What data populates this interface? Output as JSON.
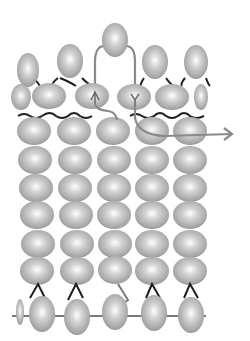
{
  "diagram": {
    "type": "bead-weaving-thread-path",
    "bead_color": "#b4b4b4",
    "thread_color_black": "#1e1e1e",
    "thread_color_path": "#8a8a8a",
    "grid": {
      "columns": [
        34,
        74,
        113,
        152,
        190
      ],
      "rows": [
        130,
        158,
        186,
        214,
        242,
        271
      ],
      "bead_rx": 17,
      "bead_ry": 14
    },
    "top_row": [
      {
        "cx": 28,
        "cy": 68,
        "rx": 14,
        "ry": 17
      },
      {
        "cx": 70,
        "cy": 59,
        "rx": 13,
        "ry": 17
      },
      {
        "cx": 115,
        "cy": 40,
        "rx": 13,
        "ry": 17
      },
      {
        "cx": 155,
        "cy": 60,
        "rx": 13,
        "ry": 17
      },
      {
        "cx": 196,
        "cy": 62,
        "rx": 12,
        "ry": 17
      }
    ],
    "second_row": [
      {
        "cx": 22,
        "cy": 97,
        "rx": 10,
        "ry": 13
      },
      {
        "cx": 49,
        "cy": 95,
        "rx": 17,
        "ry": 13
      },
      {
        "cx": 92,
        "cy": 95,
        "rx": 17,
        "ry": 13
      },
      {
        "cx": 134,
        "cy": 96,
        "rx": 17,
        "ry": 13
      },
      {
        "cx": 173,
        "cy": 96,
        "rx": 17,
        "ry": 13
      },
      {
        "cx": 200,
        "cy": 96,
        "rx": 8,
        "ry": 13
      }
    ],
    "bottom_row": [
      {
        "cx": 20,
        "cy": 310,
        "rx": 4,
        "ry": 14
      },
      {
        "cx": 42,
        "cy": 312,
        "rx": 13,
        "ry": 18
      },
      {
        "cx": 77,
        "cy": 315,
        "rx": 13,
        "ry": 18
      },
      {
        "cx": 115,
        "cy": 310,
        "rx": 13,
        "ry": 18
      },
      {
        "cx": 154,
        "cy": 312,
        "rx": 13,
        "ry": 18
      },
      {
        "cx": 191,
        "cy": 313,
        "rx": 13,
        "ry": 18
      }
    ],
    "arrow_label": "thread exit arrow"
  }
}
